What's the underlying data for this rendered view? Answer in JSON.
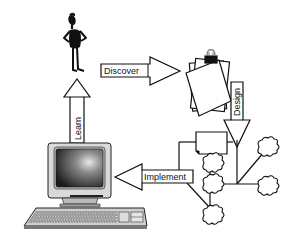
{
  "diagram": {
    "type": "process-cycle",
    "nodes": [
      {
        "id": "person",
        "icon": "person-icon",
        "description": "standing figure"
      },
      {
        "id": "documents",
        "icon": "clipped-documents-icon",
        "description": "stack of papers with binder clip"
      },
      {
        "id": "network",
        "icon": "tree-network-icon",
        "description": "branching tree with document and cloud nodes"
      },
      {
        "id": "computer",
        "icon": "computer-icon",
        "description": "monitor and keyboard"
      }
    ],
    "edges": [
      {
        "from": "person",
        "to": "documents",
        "label": "Discover"
      },
      {
        "from": "documents",
        "to": "network",
        "label": "Design"
      },
      {
        "from": "network",
        "to": "computer",
        "label": "Implement"
      },
      {
        "from": "computer",
        "to": "person",
        "label": "Learn"
      }
    ]
  },
  "labels": {
    "discover": "Discover",
    "design": "Design",
    "implement": "Implement",
    "learn": "Learn"
  }
}
